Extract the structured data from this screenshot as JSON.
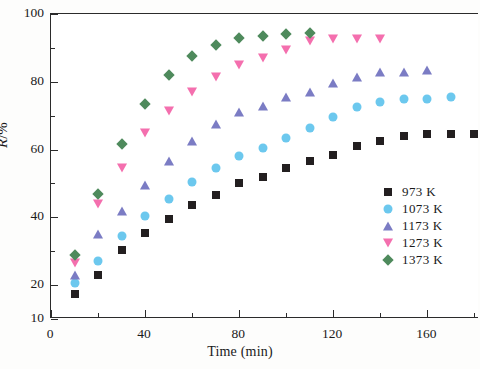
{
  "chart_data": {
    "type": "scatter",
    "title": "",
    "xlabel": "Time (min)",
    "ylabel": "R/%",
    "xlim": [
      0,
      182
    ],
    "ylim": [
      10,
      100
    ],
    "xticks": [
      0,
      40,
      80,
      120,
      160
    ],
    "xticks_minor": [
      20,
      60,
      100,
      140,
      180
    ],
    "yticks": [
      10,
      20,
      40,
      60,
      80,
      100
    ],
    "yticks_minor": [
      30,
      50,
      70,
      90
    ],
    "grid": false,
    "legend_position": "lower right",
    "series": [
      {
        "name": "973 K",
        "marker": "square",
        "color": "#231f20",
        "x": [
          10,
          20,
          30,
          40,
          50,
          60,
          70,
          80,
          90,
          100,
          110,
          120,
          130,
          140,
          150,
          160,
          170,
          180
        ],
        "y": [
          17.5,
          23.0,
          30.5,
          35.5,
          39.5,
          43.5,
          46.5,
          50.0,
          52.0,
          54.5,
          56.5,
          58.5,
          61.0,
          62.5,
          64.0,
          64.5,
          64.5,
          64.5
        ]
      },
      {
        "name": "1073 K",
        "marker": "circle",
        "color": "#6cc8ee",
        "x": [
          10,
          20,
          30,
          40,
          50,
          60,
          70,
          80,
          90,
          100,
          110,
          120,
          130,
          140,
          150,
          160,
          170
        ],
        "y": [
          20.5,
          27.0,
          34.5,
          40.5,
          45.5,
          50.5,
          54.5,
          58.0,
          60.5,
          63.5,
          66.5,
          69.5,
          72.5,
          74.0,
          75.0,
          75.0,
          75.5
        ]
      },
      {
        "name": "1173 K",
        "marker": "triangle-up",
        "color": "#7b7cc4",
        "x": [
          10,
          20,
          30,
          40,
          50,
          60,
          70,
          80,
          90,
          100,
          110,
          120,
          130,
          140,
          150,
          160
        ],
        "y": [
          23.0,
          35.0,
          42.0,
          49.5,
          56.5,
          62.5,
          67.5,
          71.0,
          73.0,
          75.5,
          77.0,
          79.5,
          81.5,
          83.0,
          83.0,
          83.5
        ]
      },
      {
        "name": "1273 K",
        "marker": "triangle-down",
        "color": "#f46fae",
        "x": [
          10,
          20,
          30,
          40,
          50,
          60,
          70,
          80,
          90,
          100,
          110,
          120,
          130,
          140
        ],
        "y": [
          26.5,
          44.0,
          54.5,
          65.0,
          71.5,
          77.0,
          81.5,
          85.0,
          87.0,
          89.5,
          92.0,
          92.5,
          92.5,
          92.5
        ]
      },
      {
        "name": "1373 K",
        "marker": "diamond",
        "color": "#4e8a5c",
        "x": [
          10,
          20,
          30,
          40,
          50,
          60,
          70,
          80,
          90,
          100,
          110
        ],
        "y": [
          29.0,
          47.0,
          61.5,
          73.5,
          82.0,
          87.5,
          91.0,
          93.0,
          93.5,
          94.0,
          94.5
        ]
      }
    ]
  },
  "axes": {
    "x_title": "Time (min)",
    "y_title_symbol": "R",
    "y_title_unit": "/%"
  },
  "legend": {
    "entries": [
      {
        "label": "973  K",
        "marker": "square-icon"
      },
      {
        "label": "1073 K",
        "marker": "circle-icon"
      },
      {
        "label": "1173 K",
        "marker": "triangle-up-icon"
      },
      {
        "label": "1273 K",
        "marker": "triangle-down-icon"
      },
      {
        "label": "1373 K",
        "marker": "diamond-icon"
      }
    ]
  }
}
